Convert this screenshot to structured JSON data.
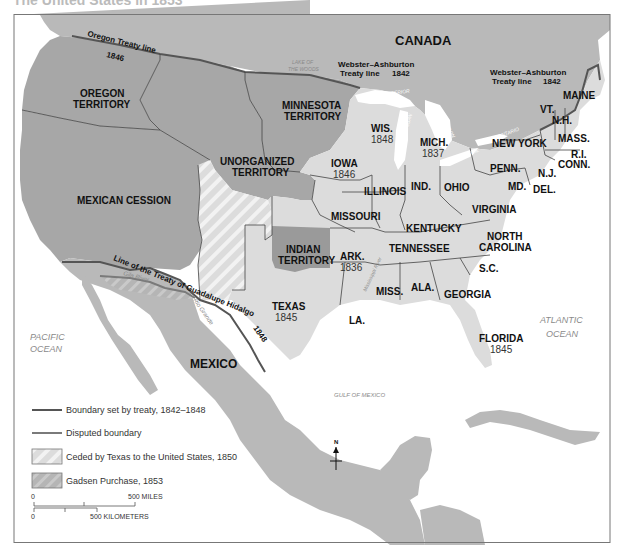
{
  "title": "The United States in 1853",
  "colors": {
    "foreign_land": "#b9b9b9",
    "territory": "#a7a7a7",
    "state": "#dcdcdc",
    "indian_territory": "#9a9a9a",
    "water": "#ffffff",
    "boundary_treaty": "#555555",
    "disputed_boundary": "#777777",
    "state_line": "#444444"
  },
  "countries": {
    "canada": "CANADA",
    "mexico": "MEXICO"
  },
  "waters": {
    "pacific": [
      "PACIFIC",
      "OCEAN"
    ],
    "atlantic": [
      "ATLANTIC",
      "OCEAN"
    ],
    "gulf": "GULF OF MEXICO",
    "lake_superior": "LAKE SUPERIOR",
    "lake_michigan": "LAKE MICHIGAN",
    "lake_huron": "LAKE HURON",
    "lake_erie": "LAKE ERIE",
    "lake_ontario": "LAKE ONTARIO",
    "lake_of_the_woods": [
      "LAKE OF",
      "THE WOODS"
    ],
    "gila_river": "Gila River",
    "rio_grande": "Rio Grande",
    "mississippi_river": "Mississippi River"
  },
  "territories": {
    "oregon": [
      "OREGON",
      "TERRITORY"
    ],
    "minnesota": [
      "MINNESOTA",
      "TERRITORY"
    ],
    "unorganized": [
      "UNORGANIZED",
      "TERRITORY"
    ],
    "mexican_cession": "MEXICAN CESSION",
    "indian": [
      "INDIAN",
      "TERRITORY"
    ]
  },
  "states": {
    "wis": {
      "name": "WIS.",
      "year": "1848"
    },
    "mich": {
      "name": "MICH.",
      "year": "1837"
    },
    "iowa": {
      "name": "IOWA",
      "year": "1846"
    },
    "ark": {
      "name": "ARK.",
      "year": "1836"
    },
    "texas": {
      "name": "TEXAS",
      "year": "1845"
    },
    "florida": {
      "name": "FLORIDA",
      "year": "1845"
    },
    "illinois": "ILLINOIS",
    "ind": "IND.",
    "ohio": "OHIO",
    "missouri": "MISSOURI",
    "kentucky": "KENTUCKY",
    "tennessee": "TENNESSEE",
    "virginia": "VIRGINIA",
    "north_carolina": [
      "NORTH",
      "CAROLINA"
    ],
    "sc": "S.C.",
    "georgia": "GEORGIA",
    "ala": "ALA.",
    "miss": "MISS.",
    "la": "LA.",
    "penn": "PENN.",
    "new_york": "NEW YORK",
    "md": "MD.",
    "del": "DEL.",
    "nj": "N.J.",
    "conn": "CONN.",
    "ri": "R.I.",
    "mass": "MASS.",
    "nh": "N.H.",
    "vt": "VT.",
    "maine": "MAINE"
  },
  "treaty_lines": {
    "oregon": [
      "Oregon Treaty line",
      "1846"
    ],
    "webster_west": [
      "Webster–Ashburton",
      "Treaty line",
      "1842"
    ],
    "webster_east": [
      "Webster–Ashburton",
      "Treaty line",
      "1842"
    ],
    "guadalupe": "Line of the Treaty of Guadalupe Hidalgo",
    "guadalupe_year": "1848"
  },
  "compass": "N",
  "legend": {
    "items": [
      {
        "label": "Boundary set by treaty, 1842–1848",
        "type": "line"
      },
      {
        "label": "Disputed boundary",
        "type": "line"
      },
      {
        "label": "Ceded by Texas to the United States, 1850",
        "type": "hatch"
      },
      {
        "label": "Gadsen Purchase, 1853",
        "type": "gray-hatch"
      }
    ],
    "scale": {
      "miles_start": "0",
      "miles_end": "500 MILES",
      "km_start": "0",
      "km_end": "500 KILOMETERS"
    }
  }
}
